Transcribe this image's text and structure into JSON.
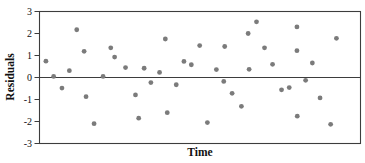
{
  "chart_data": {
    "type": "scatter",
    "title": "",
    "xlabel": "Time",
    "ylabel": "Residuals",
    "ylim": [
      -3,
      3
    ],
    "yticks": [
      3,
      2,
      1,
      0,
      -1,
      -2,
      -3
    ],
    "x_tick_labels_shown": false,
    "grid": false,
    "legend": "none",
    "reference_line_y": 0,
    "point_color": "#7b7b7b",
    "axis_color": "#3d3d3d",
    "tick_label_color": "#111111",
    "points": [
      {
        "t": 0.02,
        "y": 0.74
      },
      {
        "t": 0.044,
        "y": 0.05
      },
      {
        "t": 0.07,
        "y": -0.48
      },
      {
        "t": 0.093,
        "y": 0.31
      },
      {
        "t": 0.116,
        "y": 2.17
      },
      {
        "t": 0.139,
        "y": 1.19
      },
      {
        "t": 0.145,
        "y": -0.87
      },
      {
        "t": 0.17,
        "y": -2.1
      },
      {
        "t": 0.198,
        "y": 0.05
      },
      {
        "t": 0.222,
        "y": 1.35
      },
      {
        "t": 0.234,
        "y": 0.93
      },
      {
        "t": 0.268,
        "y": 0.45
      },
      {
        "t": 0.299,
        "y": -0.79
      },
      {
        "t": 0.309,
        "y": -1.85
      },
      {
        "t": 0.326,
        "y": 0.42
      },
      {
        "t": 0.347,
        "y": -0.23
      },
      {
        "t": 0.374,
        "y": 0.23
      },
      {
        "t": 0.392,
        "y": 1.75
      },
      {
        "t": 0.398,
        "y": -1.6
      },
      {
        "t": 0.426,
        "y": -0.33
      },
      {
        "t": 0.45,
        "y": 0.73
      },
      {
        "t": 0.473,
        "y": 0.58
      },
      {
        "t": 0.499,
        "y": 1.45
      },
      {
        "t": 0.523,
        "y": -2.05
      },
      {
        "t": 0.551,
        "y": 0.36
      },
      {
        "t": 0.574,
        "y": -0.18
      },
      {
        "t": 0.577,
        "y": 1.41
      },
      {
        "t": 0.6,
        "y": -0.72
      },
      {
        "t": 0.629,
        "y": -1.31
      },
      {
        "t": 0.65,
        "y": 2.0
      },
      {
        "t": 0.653,
        "y": 0.37
      },
      {
        "t": 0.676,
        "y": 2.53
      },
      {
        "t": 0.701,
        "y": 1.35
      },
      {
        "t": 0.726,
        "y": 0.6
      },
      {
        "t": 0.754,
        "y": -0.56
      },
      {
        "t": 0.778,
        "y": -0.46
      },
      {
        "t": 0.802,
        "y": 2.3
      },
      {
        "t": 0.802,
        "y": 1.22
      },
      {
        "t": 0.803,
        "y": -1.76
      },
      {
        "t": 0.829,
        "y": -0.13
      },
      {
        "t": 0.85,
        "y": 0.66
      },
      {
        "t": 0.874,
        "y": -0.93
      },
      {
        "t": 0.907,
        "y": -2.13
      },
      {
        "t": 0.925,
        "y": 1.78
      }
    ]
  }
}
